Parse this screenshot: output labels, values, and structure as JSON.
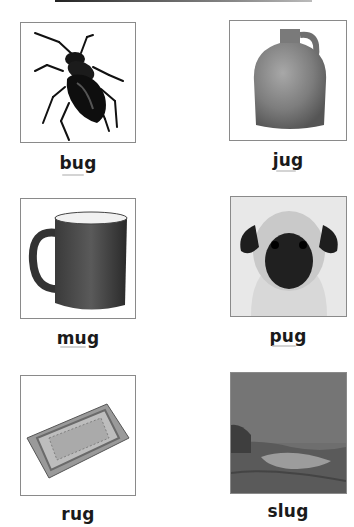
{
  "worksheet": {
    "title_rule": "top-divider",
    "items": [
      {
        "word": "bug",
        "image": "beetle-illustration"
      },
      {
        "word": "jug",
        "image": "stoneware-jug-photo"
      },
      {
        "word": "mug",
        "image": "dark-coffee-mug-photo"
      },
      {
        "word": "pug",
        "image": "pug-dog-photo"
      },
      {
        "word": "rug",
        "image": "patterned-rug-photo"
      },
      {
        "word": "slug",
        "image": "slug-on-rock-photo"
      }
    ]
  }
}
